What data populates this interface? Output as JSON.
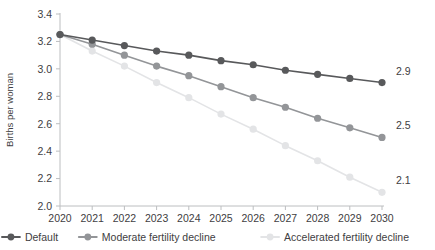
{
  "chart_data": {
    "type": "line",
    "title": "",
    "xlabel": "",
    "ylabel": "Births per woman",
    "x": [
      2020,
      2021,
      2022,
      2023,
      2024,
      2025,
      2026,
      2027,
      2028,
      2029,
      2030
    ],
    "xtick_labels": [
      "2020",
      "2021",
      "2022",
      "2023",
      "2024",
      "2025",
      "2026",
      "2027",
      "2028",
      "2029",
      "2030"
    ],
    "ytick_labels": [
      "3.4",
      "3.2",
      "3.0",
      "2.8",
      "2.6",
      "2.4",
      "2.2",
      "2.0"
    ],
    "ytick_values": [
      3.4,
      3.2,
      3.0,
      2.8,
      2.6,
      2.4,
      2.2,
      2.0
    ],
    "ylim": [
      2.0,
      3.4
    ],
    "xlim": [
      2020,
      2030
    ],
    "grid": false,
    "legend_position": "bottom",
    "series": [
      {
        "name": "Default",
        "color": "#58595b",
        "values": [
          3.25,
          3.21,
          3.17,
          3.13,
          3.1,
          3.06,
          3.03,
          2.99,
          2.96,
          2.93,
          2.9
        ],
        "end_label": "2.9"
      },
      {
        "name": "Moderate fertility decline",
        "color": "#939598",
        "values": [
          3.25,
          3.18,
          3.1,
          3.02,
          2.95,
          2.87,
          2.79,
          2.72,
          2.64,
          2.57,
          2.5
        ],
        "end_label": "2.5"
      },
      {
        "name": "Accelerated fertility decline",
        "color": "#e3e4e6",
        "values": [
          3.25,
          3.13,
          3.02,
          2.9,
          2.79,
          2.67,
          2.56,
          2.44,
          2.33,
          2.21,
          2.1
        ],
        "end_label": "2.1"
      }
    ]
  },
  "legend": {
    "items": [
      {
        "label": "Default",
        "color": "#58595b"
      },
      {
        "label": "Moderate fertility decline",
        "color": "#939598"
      },
      {
        "label": "Accelerated fertility decline",
        "color": "#e3e4e6"
      }
    ]
  }
}
